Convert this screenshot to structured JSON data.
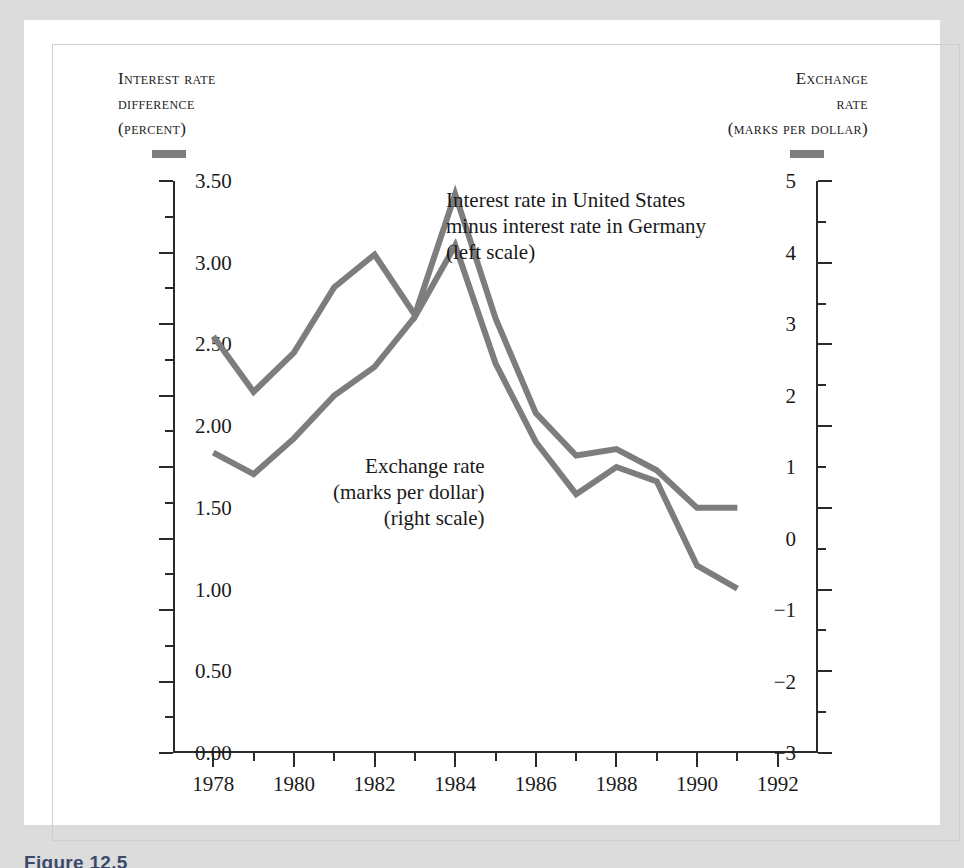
{
  "figure": {
    "caption": "Figure 12.5",
    "line_color": "#7d7d7d",
    "axis_color": "#2a2a2a",
    "panel_color": "#ffffff",
    "mat_color": "#dcdcdc"
  },
  "header": {
    "left": {
      "line1": "Interest rate",
      "line2": "difference",
      "line3": "(percent)"
    },
    "right": {
      "line1": "Exchange",
      "line2": "rate",
      "line3": "(marks per dollar)"
    }
  },
  "annotations": {
    "interest": {
      "line1": "Interest rate in United States",
      "line2": "minus interest rate in Germany",
      "line3": "(left scale)"
    },
    "exchange": {
      "line1": "Exchange rate",
      "line2": "(marks per dollar)",
      "line3": "(right scale)"
    }
  },
  "chart_data": {
    "type": "line",
    "title": "",
    "xlabel": "",
    "ylabel": "Interest rate difference (percent)",
    "y2label": "Exchange rate (marks per dollar)",
    "xlim": [
      1977,
      1993
    ],
    "ylim": [
      -3,
      5
    ],
    "y2lim": [
      0.0,
      3.5
    ],
    "grid": false,
    "legend": "inline-annotations",
    "x_major_ticks": [
      1978,
      1980,
      1982,
      1984,
      1986,
      1988,
      1990,
      1992
    ],
    "x_minor_ticks": [
      1977,
      1979,
      1981,
      1983,
      1985,
      1987,
      1989,
      1991,
      1993
    ],
    "x_tick_labels": [
      "1978",
      "1980",
      "1982",
      "1984",
      "1986",
      "1988",
      "1990",
      "1992"
    ],
    "y_major_ticks": [
      -3,
      -2,
      -1,
      0,
      1,
      2,
      3,
      4,
      5
    ],
    "y_minor_ticks": [
      -2.5,
      -1.5,
      -0.5,
      0.5,
      1.5,
      2.5,
      3.5,
      4.5
    ],
    "y_tick_labels": [
      "5",
      "4",
      "3",
      "2",
      "1",
      "0",
      "−1",
      "−2",
      "−3"
    ],
    "y2_major_ticks": [
      0.0,
      0.5,
      1.0,
      1.5,
      2.0,
      2.5,
      3.0,
      3.5
    ],
    "y2_minor_ticks": [
      0.25,
      0.75,
      1.25,
      1.75,
      2.25,
      2.75,
      3.25
    ],
    "y2_tick_labels": [
      "3.50",
      "3.00",
      "2.50",
      "2.00",
      "1.50",
      "1.00",
      "0.50",
      "0.00"
    ],
    "x": [
      1978,
      1979,
      1980,
      1981,
      1982,
      1983,
      1984,
      1985,
      1986,
      1987,
      1988,
      1989,
      1990,
      1991
    ],
    "series": [
      {
        "name": "Interest rate in United States minus interest rate in Germany (left scale)",
        "axis": "left",
        "color": "#7d7d7d",
        "values": [
          1.2,
          0.9,
          1.4,
          2.0,
          2.4,
          3.1,
          4.1,
          2.45,
          1.35,
          0.62,
          1.0,
          0.8,
          -0.38,
          -0.7
        ]
      },
      {
        "name": "Exchange rate (marks per dollar) (right scale)",
        "axis": "right",
        "color": "#7d7d7d",
        "values": [
          2.55,
          2.21,
          2.45,
          2.85,
          3.05,
          2.68,
          3.42,
          2.66,
          2.08,
          1.82,
          1.86,
          1.73,
          1.5,
          1.5
        ]
      }
    ]
  }
}
